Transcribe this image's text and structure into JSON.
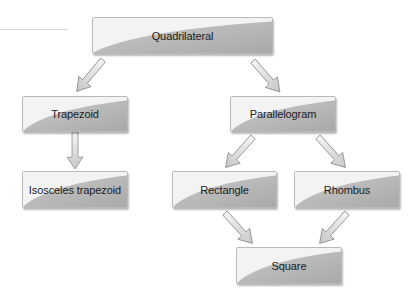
{
  "diagram": {
    "type": "hierarchy",
    "title": "",
    "nodes": [
      {
        "id": "quadrilateral",
        "label": "Quadrilateral"
      },
      {
        "id": "trapezoid",
        "label": "Trapezoid"
      },
      {
        "id": "parallelogram",
        "label": "Parallelogram"
      },
      {
        "id": "isosceles_trapezoid",
        "label": "Isosceles trapezoid"
      },
      {
        "id": "rectangle",
        "label": "Rectangle"
      },
      {
        "id": "rhombus",
        "label": "Rhombus"
      },
      {
        "id": "square",
        "label": "Square"
      }
    ],
    "edges": [
      {
        "from": "quadrilateral",
        "to": "trapezoid"
      },
      {
        "from": "quadrilateral",
        "to": "parallelogram"
      },
      {
        "from": "trapezoid",
        "to": "isosceles_trapezoid"
      },
      {
        "from": "parallelogram",
        "to": "rectangle"
      },
      {
        "from": "parallelogram",
        "to": "rhombus"
      },
      {
        "from": "rectangle",
        "to": "square"
      },
      {
        "from": "rhombus",
        "to": "square"
      }
    ]
  },
  "labels": {
    "quadrilateral": "Quadrilateral",
    "trapezoid": "Trapezoid",
    "parallelogram": "Parallelogram",
    "isosceles_trapezoid": "Isosceles trapezoid",
    "rectangle": "Rectangle",
    "rhombus": "Rhombus",
    "square": "Square"
  },
  "colors": {
    "box_light": "#f4f4f4",
    "box_dark": "#b4b4b4",
    "box_border": "#b9b9b9",
    "arrow_fill": "#dcdcdc",
    "arrow_stroke": "#8a8a8a",
    "text": "#1a1a1a"
  }
}
